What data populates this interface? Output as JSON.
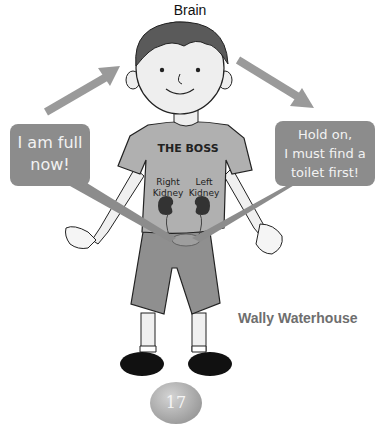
{
  "labels": {
    "brain": "Brain",
    "shirt_text": "THE BOSS",
    "right_kidney_line1": "Right",
    "right_kidney_line2": "Kidney",
    "left_kidney_line1": "Left",
    "left_kidney_line2": "Kidney"
  },
  "bubbles": {
    "left": {
      "line1": "I am full",
      "line2": "now!"
    },
    "right": {
      "line1": "Hold on,",
      "line2": "I must find a",
      "line3": "toilet first!"
    }
  },
  "character_name": "Wally Waterhouse",
  "page_number": "17",
  "colors": {
    "arrow": "#9a9a9a",
    "bubble": "#8c8c8c",
    "shirt": "#b0b0b0",
    "shorts": "#8f8f8f",
    "hair": "#5a5a5a",
    "skin": "#eeeeee",
    "shoes": "#111111"
  }
}
